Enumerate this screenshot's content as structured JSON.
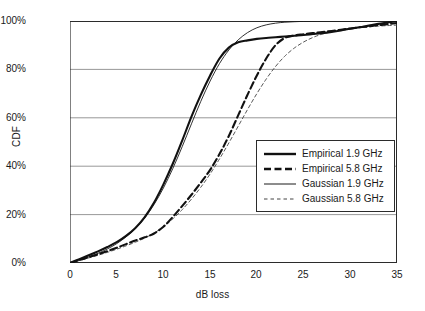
{
  "chart_data": {
    "type": "line",
    "title": "",
    "xlabel": "dB loss",
    "ylabel": "CDF",
    "xlim": [
      0,
      35
    ],
    "ylim": [
      0,
      100
    ],
    "xticks": [
      0,
      5,
      10,
      15,
      20,
      25,
      30,
      35
    ],
    "xtick_labels": [
      "0",
      "5",
      "10",
      "15",
      "20",
      "25",
      "30",
      "35"
    ],
    "yticks": [
      0,
      20,
      40,
      60,
      80,
      100
    ],
    "ytick_labels": [
      "0%",
      "20%",
      "40%",
      "60%",
      "80%",
      "100%"
    ],
    "grid": "horizontal",
    "legend_position": "center-right-inside",
    "series": [
      {
        "name": "Empirical 1.9 GHz",
        "style": "solid",
        "width": 2.1,
        "color": "#111111",
        "x": [
          0,
          1,
          2,
          3,
          4,
          5,
          6,
          7,
          8,
          9,
          10,
          11,
          12,
          13,
          14,
          15,
          16,
          17,
          18,
          19,
          20,
          21,
          22,
          23,
          24,
          25,
          26,
          27,
          28,
          29,
          30,
          31,
          32,
          33,
          34,
          35
        ],
        "y": [
          0,
          1.6,
          3.2,
          4.8,
          6.6,
          8.6,
          11.2,
          14.5,
          19.0,
          25.0,
          32.5,
          41.0,
          50.5,
          60.5,
          69.5,
          77.5,
          84.5,
          89.0,
          91.2,
          92.0,
          92.6,
          93.0,
          93.3,
          93.6,
          93.9,
          94.2,
          94.6,
          95.0,
          95.5,
          96.1,
          96.8,
          97.4,
          98.1,
          98.8,
          99.4,
          100
        ]
      },
      {
        "name": "Empirical 5.8 GHz",
        "style": "dashed",
        "width": 2.1,
        "color": "#111111",
        "x": [
          0,
          1,
          2,
          3,
          4,
          5,
          6,
          7,
          8,
          9,
          10,
          11,
          12,
          13,
          14,
          15,
          16,
          17,
          18,
          19,
          20,
          21,
          22,
          23,
          24,
          25,
          26,
          27,
          28,
          29,
          30,
          31,
          32,
          33,
          34,
          35
        ],
        "y": [
          0,
          1.2,
          2.4,
          3.6,
          4.9,
          6.3,
          7.8,
          9.3,
          10.6,
          12.2,
          15.0,
          19.0,
          23.5,
          28.2,
          33.2,
          38.5,
          45.0,
          52.5,
          61.0,
          69.5,
          77.5,
          84.5,
          90.0,
          93.0,
          94.0,
          94.5,
          95.0,
          95.4,
          95.9,
          96.4,
          96.9,
          97.4,
          97.8,
          98.3,
          98.7,
          99.2
        ]
      },
      {
        "name": "Gaussian 1.9 GHz",
        "style": "solid",
        "width": 0.9,
        "color": "#1a1a1a",
        "x": [
          0,
          1,
          2,
          3,
          4,
          5,
          6,
          7,
          8,
          9,
          10,
          11,
          12,
          13,
          14,
          15,
          16,
          17,
          18,
          19,
          20,
          21,
          22,
          23,
          24,
          25,
          26,
          27,
          28,
          29,
          30,
          31,
          32,
          33,
          34,
          35
        ],
        "y": [
          0,
          1.2,
          2.5,
          4.0,
          5.8,
          8.0,
          10.8,
          14.2,
          18.6,
          24.2,
          31.0,
          39.0,
          48.0,
          57.5,
          66.8,
          75.2,
          82.4,
          88.0,
          92.2,
          95.2,
          97.2,
          98.4,
          99.1,
          99.5,
          99.7,
          99.85,
          99.9,
          99.93,
          99.95,
          99.96,
          99.97,
          99.98,
          99.99,
          100,
          100,
          100
        ]
      },
      {
        "name": "Gaussian 5.8 GHz",
        "style": "fine-dashed",
        "width": 0.9,
        "color": "#444444",
        "x": [
          0,
          1,
          2,
          3,
          4,
          5,
          6,
          7,
          8,
          9,
          10,
          11,
          12,
          13,
          14,
          15,
          16,
          17,
          18,
          19,
          20,
          21,
          22,
          23,
          24,
          25,
          26,
          27,
          28,
          29,
          30,
          31,
          32,
          33,
          34,
          35
        ],
        "y": [
          0,
          1.0,
          2.1,
          3.2,
          4.4,
          5.7,
          7.1,
          8.6,
          10.3,
          12.4,
          15.0,
          18.2,
          22.0,
          26.4,
          31.3,
          36.8,
          43.0,
          49.6,
          56.5,
          63.4,
          70.0,
          76.0,
          81.2,
          85.5,
          88.8,
          91.3,
          93.2,
          94.6,
          95.6,
          96.3,
          96.9,
          97.3,
          97.6,
          97.9,
          98.1,
          98.3
        ]
      }
    ]
  },
  "legend": {
    "items": [
      {
        "label": "Empirical 1.9 GHz"
      },
      {
        "label": "Empirical 5.8 GHz"
      },
      {
        "label": "Gaussian 1.9 GHz"
      },
      {
        "label": "Gaussian 5.8 GHz"
      }
    ]
  },
  "axes": {
    "x_title": "dB loss",
    "y_title": "CDF"
  },
  "colors": {
    "axis": "#2b2b2b",
    "gridline": "#8c8c8c",
    "background": "#ffffff",
    "ink": "#111111"
  }
}
